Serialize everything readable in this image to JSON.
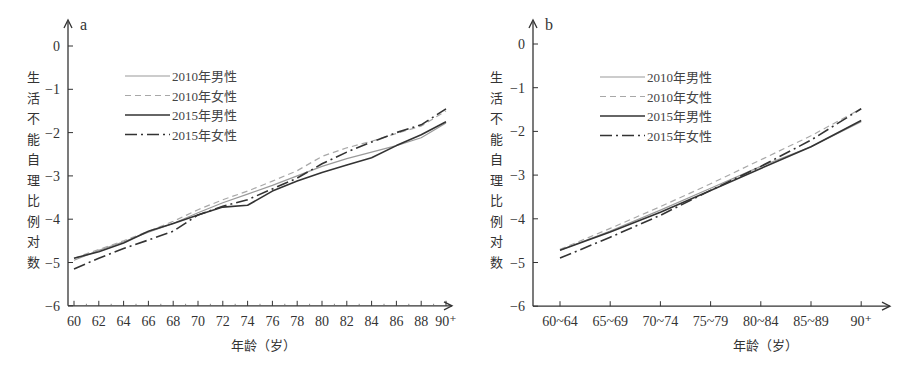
{
  "chart_data": [
    {
      "type": "line",
      "panel": "a",
      "title": "",
      "xlabel": "年龄（岁）",
      "ylabel": "生活不能自理比例对数",
      "ylim": [
        -6,
        0
      ],
      "yticks": [
        "0",
        "−1",
        "−2",
        "−3",
        "−4",
        "−5",
        "−6"
      ],
      "xticks": [
        "60",
        "62",
        "64",
        "66",
        "68",
        "70",
        "72",
        "74",
        "76",
        "78",
        "80",
        "82",
        "84",
        "86",
        "88",
        "90⁺"
      ],
      "grid": false,
      "legend_position": "upper-left",
      "x": [
        60,
        62,
        64,
        66,
        68,
        70,
        72,
        74,
        76,
        78,
        80,
        82,
        84,
        86,
        88,
        90
      ],
      "series": [
        {
          "name": "2010年男性",
          "style": "solid-thin-gray",
          "values": [
            -4.95,
            -4.72,
            -4.52,
            -4.3,
            -4.1,
            -3.85,
            -3.62,
            -3.42,
            -3.22,
            -3.0,
            -2.78,
            -2.6,
            -2.45,
            -2.3,
            -2.12,
            -1.78
          ]
        },
        {
          "name": "2010年女性",
          "style": "dashed-gray",
          "values": [
            -4.9,
            -4.7,
            -4.5,
            -4.28,
            -4.05,
            -3.78,
            -3.55,
            -3.35,
            -3.12,
            -2.88,
            -2.55,
            -2.35,
            -2.2,
            -2.02,
            -1.85,
            -1.5
          ]
        },
        {
          "name": "2015年男性",
          "style": "solid-dark",
          "values": [
            -4.9,
            -4.75,
            -4.55,
            -4.28,
            -4.1,
            -3.9,
            -3.72,
            -3.68,
            -3.35,
            -3.12,
            -2.92,
            -2.75,
            -2.58,
            -2.3,
            -2.05,
            -1.75
          ]
        },
        {
          "name": "2015年女性",
          "style": "dashdot-dark",
          "values": [
            -5.15,
            -4.9,
            -4.68,
            -4.48,
            -4.28,
            -3.9,
            -3.7,
            -3.55,
            -3.3,
            -3.05,
            -2.72,
            -2.45,
            -2.22,
            -2.0,
            -1.82,
            -1.45
          ]
        }
      ]
    },
    {
      "type": "line",
      "panel": "b",
      "title": "",
      "xlabel": "年龄（岁）",
      "ylabel": "生活不能自理比例对数",
      "ylim": [
        -6,
        0
      ],
      "yticks": [
        "0",
        "−1",
        "−2",
        "−3",
        "−4",
        "−5",
        "−6"
      ],
      "categories": [
        "60~64",
        "65~69",
        "70~74",
        "75~79",
        "80~84",
        "85~89",
        "90⁺"
      ],
      "grid": false,
      "legend_position": "upper-left",
      "series": [
        {
          "name": "2010年男性",
          "style": "solid-thin-gray",
          "values": [
            -4.72,
            -4.28,
            -3.8,
            -3.3,
            -2.8,
            -2.35,
            -1.78
          ]
        },
        {
          "name": "2010年女性",
          "style": "dashed-gray",
          "values": [
            -4.7,
            -4.22,
            -3.72,
            -3.2,
            -2.65,
            -2.1,
            -1.48
          ]
        },
        {
          "name": "2015年男性",
          "style": "solid-dark",
          "values": [
            -4.72,
            -4.3,
            -3.85,
            -3.35,
            -2.85,
            -2.35,
            -1.75
          ]
        },
        {
          "name": "2015年女性",
          "style": "dashdot-dark",
          "values": [
            -4.9,
            -4.42,
            -3.92,
            -3.35,
            -2.8,
            -2.2,
            -1.48
          ]
        }
      ]
    }
  ],
  "panels": {
    "a": {
      "label": "a"
    },
    "b": {
      "label": "b"
    }
  },
  "ylabel_chars": [
    "生",
    "活",
    "不",
    "能",
    "自",
    "理",
    "比",
    "例",
    "对",
    "数"
  ],
  "xlabel": "年龄（岁）",
  "legend": [
    "2010年男性",
    "2010年女性",
    "2015年男性",
    "2015年女性"
  ]
}
